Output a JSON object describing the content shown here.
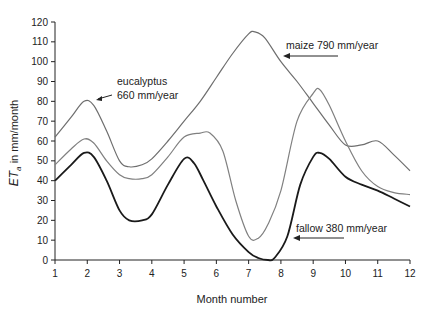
{
  "chart_data": {
    "type": "line",
    "title": "",
    "xlabel": "Month number",
    "ylabel": "ETa in mm/month",
    "ylabel_main": "ET",
    "ylabel_sub": "a",
    "ylabel_rest": " in mm/month",
    "xlim": [
      1,
      12
    ],
    "ylim": [
      0,
      120
    ],
    "grid": false,
    "legend": "annotations with arrows",
    "x_ticks": [
      1,
      2,
      3,
      4,
      5,
      6,
      7,
      8,
      9,
      10,
      11,
      12
    ],
    "y_ticks": [
      0,
      10,
      20,
      30,
      40,
      50,
      60,
      70,
      80,
      90,
      100,
      110,
      120
    ],
    "series": [
      {
        "name": "maize 790 mm/year",
        "color": "#6e6e6e",
        "x": [
          1,
          1.5,
          1.9,
          2.2,
          2.6,
          3,
          3.3,
          3.7,
          4,
          4.5,
          5,
          5.5,
          6,
          6.5,
          7,
          7.2,
          7.5,
          8,
          8.5,
          9,
          9.5,
          10,
          10.5,
          11,
          11.5,
          12
        ],
        "y": [
          62,
          72,
          80,
          78,
          65,
          50,
          47,
          48,
          51,
          60,
          70,
          80,
          92,
          104,
          114,
          115,
          112,
          100,
          90,
          79,
          68,
          58,
          58,
          60,
          53,
          45
        ]
      },
      {
        "name": "eucalyptus 660 mm/year",
        "color": "#808080",
        "x": [
          1,
          1.5,
          1.9,
          2.2,
          2.6,
          3,
          3.3,
          3.7,
          4,
          4.5,
          5,
          5.5,
          5.8,
          6.2,
          6.6,
          7,
          7.3,
          7.6,
          8,
          8.5,
          9,
          9.2,
          9.5,
          10,
          10.5,
          11,
          11.5,
          12
        ],
        "y": [
          48,
          56,
          61,
          59,
          50,
          43,
          41,
          41,
          43,
          52,
          62,
          64,
          64,
          55,
          30,
          12,
          11,
          18,
          35,
          70,
          84,
          86,
          78,
          60,
          45,
          37,
          34,
          33
        ]
      },
      {
        "name": "fallow 380 mm/year",
        "color": "#1a1a1a",
        "x": [
          1,
          1.5,
          1.9,
          2.2,
          2.6,
          3,
          3.3,
          3.7,
          4,
          4.5,
          5,
          5.3,
          5.6,
          6,
          6.5,
          7,
          7.3,
          7.6,
          7.8,
          8.2,
          8.6,
          9,
          9.2,
          9.5,
          10,
          10.5,
          11,
          11.5,
          12
        ],
        "y": [
          40,
          48,
          54,
          52,
          40,
          25,
          20,
          20,
          23,
          38,
          51,
          49,
          40,
          27,
          13,
          4,
          1,
          0,
          1,
          12,
          38,
          52,
          54,
          51,
          42,
          38,
          35,
          31,
          27
        ]
      }
    ],
    "annotations": [
      {
        "text_line1": "eucalyptus",
        "text_line2": "660 mm/year"
      },
      {
        "text_line1": "maize 790 mm/year"
      },
      {
        "text_line1": "fallow 380 mm/year"
      }
    ]
  }
}
